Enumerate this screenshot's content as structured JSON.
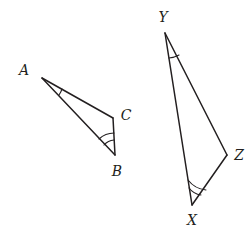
{
  "figure": {
    "background_color": "#ffffff",
    "stroke_color": "#231f20",
    "label_color": "#231f20"
  },
  "triangles": [
    {
      "name": "triangle-abc",
      "vertices": [
        {
          "label": "A",
          "x": 42,
          "y": 78,
          "label_x": 24,
          "label_y": 71
        },
        {
          "label": "C",
          "x": 113,
          "y": 118,
          "label_x": 126,
          "label_y": 116
        },
        {
          "label": "B",
          "x": 115,
          "y": 155,
          "label_x": 117,
          "label_y": 172
        }
      ],
      "angle_marks": [
        {
          "at": "A",
          "arcs": 1
        },
        {
          "at": "B",
          "arcs": 2
        }
      ]
    },
    {
      "name": "triangle-yxz",
      "vertices": [
        {
          "label": "Y",
          "x": 165,
          "y": 33,
          "label_x": 163,
          "label_y": 18
        },
        {
          "label": "Z",
          "x": 227,
          "y": 155,
          "label_x": 239,
          "label_y": 156
        },
        {
          "label": "X",
          "x": 192,
          "y": 205,
          "label_x": 192,
          "label_y": 221
        }
      ],
      "angle_marks": [
        {
          "at": "Y",
          "arcs": 1
        },
        {
          "at": "X",
          "arcs": 2
        }
      ]
    }
  ],
  "labels": {
    "a": "A",
    "b": "B",
    "c": "C",
    "x": "X",
    "y": "Y",
    "z": "Z"
  }
}
